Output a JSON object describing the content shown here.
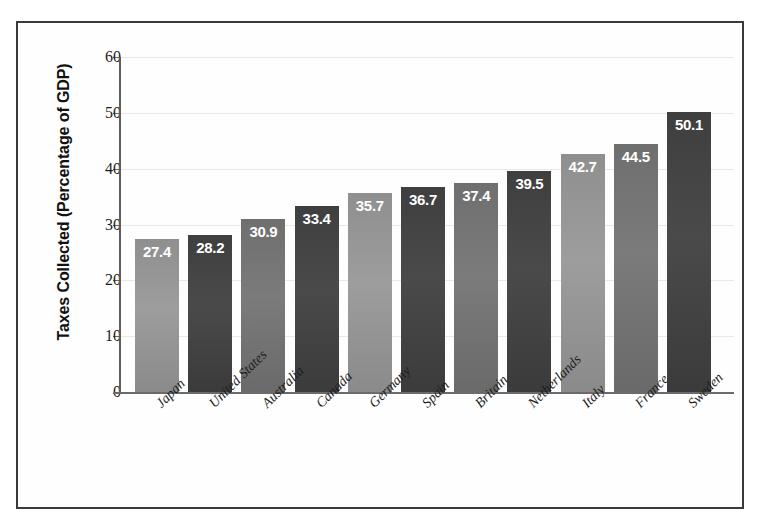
{
  "chart_data": {
    "type": "bar",
    "title": "",
    "xlabel": "",
    "ylabel": "Taxes Collected (Percentage of GDP)",
    "ylim": [
      0,
      60
    ],
    "ytick_labels": [
      "60",
      "50",
      "40",
      "30",
      "20",
      "10",
      "0"
    ],
    "ytick_values": [
      60,
      50,
      40,
      30,
      20,
      10,
      0
    ],
    "grid": true,
    "legend": "none",
    "categories": [
      "Japan",
      "United States",
      "Australia",
      "Canada",
      "Germany",
      "Spain",
      "Britain",
      "Netherlands",
      "Italy",
      "France",
      "Sweden"
    ],
    "values": [
      27.4,
      28.2,
      30.9,
      33.4,
      35.7,
      36.7,
      37.4,
      39.5,
      42.7,
      44.5,
      50.1
    ],
    "value_labels": [
      "27.4",
      "28.2",
      "30.9",
      "33.4",
      "35.7",
      "36.7",
      "37.4",
      "39.5",
      "42.7",
      "44.5",
      "50.1"
    ],
    "bar_tones": [
      "tone-light",
      "tone-dark",
      "tone-mid",
      "tone-dark",
      "tone-light",
      "tone-dark",
      "tone-mid",
      "tone-dark",
      "tone-light",
      "tone-mid",
      "tone-dark"
    ],
    "colors": {
      "tone_light": "#9d9d9d",
      "tone_mid": "#7b7b7b",
      "tone_dark": "#4a4a4a",
      "value_label_text": "#ffffff",
      "axis": "#6a6a6a",
      "grid": "#e8e8e8",
      "frame_border": "#3a3a3a",
      "background": "#ffffff"
    }
  }
}
